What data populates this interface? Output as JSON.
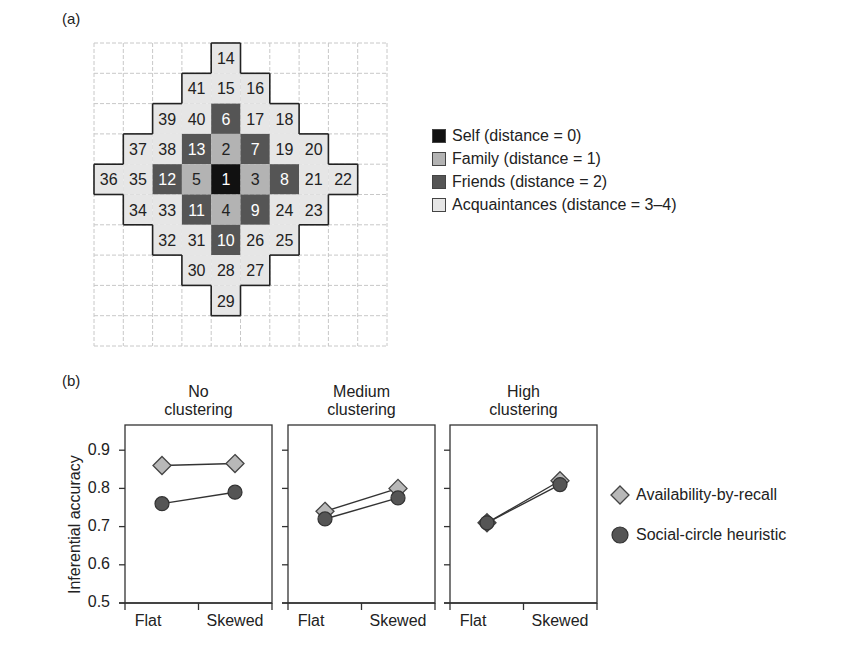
{
  "panel_a": {
    "label": "(a)",
    "grid": {
      "cols": 10,
      "rows": 10,
      "cells": [
        {
          "n": "14",
          "r": 0,
          "c": 4,
          "cat": "acq"
        },
        {
          "n": "41",
          "r": 1,
          "c": 3,
          "cat": "acq"
        },
        {
          "n": "15",
          "r": 1,
          "c": 4,
          "cat": "acq"
        },
        {
          "n": "16",
          "r": 1,
          "c": 5,
          "cat": "acq"
        },
        {
          "n": "39",
          "r": 2,
          "c": 2,
          "cat": "acq"
        },
        {
          "n": "40",
          "r": 2,
          "c": 3,
          "cat": "acq"
        },
        {
          "n": "6",
          "r": 2,
          "c": 4,
          "cat": "friends"
        },
        {
          "n": "17",
          "r": 2,
          "c": 5,
          "cat": "acq"
        },
        {
          "n": "18",
          "r": 2,
          "c": 6,
          "cat": "acq"
        },
        {
          "n": "37",
          "r": 3,
          "c": 1,
          "cat": "acq"
        },
        {
          "n": "38",
          "r": 3,
          "c": 2,
          "cat": "acq"
        },
        {
          "n": "13",
          "r": 3,
          "c": 3,
          "cat": "friends"
        },
        {
          "n": "2",
          "r": 3,
          "c": 4,
          "cat": "family"
        },
        {
          "n": "7",
          "r": 3,
          "c": 5,
          "cat": "friends"
        },
        {
          "n": "19",
          "r": 3,
          "c": 6,
          "cat": "acq"
        },
        {
          "n": "20",
          "r": 3,
          "c": 7,
          "cat": "acq"
        },
        {
          "n": "36",
          "r": 4,
          "c": 0,
          "cat": "acq"
        },
        {
          "n": "35",
          "r": 4,
          "c": 1,
          "cat": "acq"
        },
        {
          "n": "12",
          "r": 4,
          "c": 2,
          "cat": "friends"
        },
        {
          "n": "5",
          "r": 4,
          "c": 3,
          "cat": "family"
        },
        {
          "n": "1",
          "r": 4,
          "c": 4,
          "cat": "self"
        },
        {
          "n": "3",
          "r": 4,
          "c": 5,
          "cat": "family"
        },
        {
          "n": "8",
          "r": 4,
          "c": 6,
          "cat": "friends"
        },
        {
          "n": "21",
          "r": 4,
          "c": 7,
          "cat": "acq"
        },
        {
          "n": "22",
          "r": 4,
          "c": 8,
          "cat": "acq"
        },
        {
          "n": "34",
          "r": 5,
          "c": 1,
          "cat": "acq"
        },
        {
          "n": "33",
          "r": 5,
          "c": 2,
          "cat": "acq"
        },
        {
          "n": "11",
          "r": 5,
          "c": 3,
          "cat": "friends"
        },
        {
          "n": "4",
          "r": 5,
          "c": 4,
          "cat": "family"
        },
        {
          "n": "9",
          "r": 5,
          "c": 5,
          "cat": "friends"
        },
        {
          "n": "24",
          "r": 5,
          "c": 6,
          "cat": "acq"
        },
        {
          "n": "23",
          "r": 5,
          "c": 7,
          "cat": "acq"
        },
        {
          "n": "32",
          "r": 6,
          "c": 2,
          "cat": "acq"
        },
        {
          "n": "31",
          "r": 6,
          "c": 3,
          "cat": "acq"
        },
        {
          "n": "10",
          "r": 6,
          "c": 4,
          "cat": "friends"
        },
        {
          "n": "26",
          "r": 6,
          "c": 5,
          "cat": "acq"
        },
        {
          "n": "25",
          "r": 6,
          "c": 6,
          "cat": "acq"
        },
        {
          "n": "30",
          "r": 7,
          "c": 3,
          "cat": "acq"
        },
        {
          "n": "28",
          "r": 7,
          "c": 4,
          "cat": "acq"
        },
        {
          "n": "27",
          "r": 7,
          "c": 5,
          "cat": "acq"
        },
        {
          "n": "29",
          "r": 8,
          "c": 4,
          "cat": "acq"
        }
      ]
    },
    "legend": [
      {
        "key": "self",
        "label": "Self (distance = 0)",
        "color": "#111111"
      },
      {
        "key": "family",
        "label": "Family (distance = 1)",
        "color": "#b3b3b3"
      },
      {
        "key": "friends",
        "label": "Friends (distance = 2)",
        "color": "#555555"
      },
      {
        "key": "acq",
        "label": "Acquaintances (distance = 3–4)",
        "color": "#e6e6e6"
      }
    ]
  },
  "panel_b": {
    "label": "(b)",
    "ylabel": "Inferential accuracy",
    "yticks": [
      "0.9",
      "0.8",
      "0.7",
      "0.6",
      "0.5"
    ],
    "xticks": [
      "Flat",
      "Skewed"
    ],
    "panels": [
      {
        "title_line1": "No",
        "title_line2": "clustering"
      },
      {
        "title_line1": "Medium",
        "title_line2": "clustering"
      },
      {
        "title_line1": "High",
        "title_line2": "clustering"
      }
    ],
    "legend": [
      {
        "label": "Availability-by-recall",
        "marker": "diamond",
        "color": "#b8b8b8"
      },
      {
        "label": "Social-circle heuristic",
        "marker": "circle",
        "color": "#555555"
      }
    ]
  },
  "chart_data": [
    {
      "type": "table",
      "title": "(a) Social network grid",
      "categories": [
        "Self (distance = 0)",
        "Family (distance = 1)",
        "Friends (distance = 2)",
        "Acquaintances (distance = 3–4)"
      ],
      "grid_size": [
        10,
        10
      ],
      "members": {
        "self": [
          "1"
        ],
        "family": [
          "2",
          "3",
          "4",
          "5"
        ],
        "friends": [
          "6",
          "7",
          "8",
          "9",
          "10",
          "11",
          "12",
          "13"
        ],
        "acquaintances": [
          "14",
          "15",
          "16",
          "17",
          "18",
          "19",
          "20",
          "21",
          "22",
          "23",
          "24",
          "25",
          "26",
          "27",
          "28",
          "29",
          "30",
          "31",
          "32",
          "33",
          "34",
          "35",
          "36",
          "37",
          "38",
          "39",
          "40",
          "41"
        ]
      }
    },
    {
      "type": "line",
      "title": "(b) Inferential accuracy by clustering",
      "subplots": [
        "No clustering",
        "Medium clustering",
        "High clustering"
      ],
      "categories": [
        "Flat",
        "Skewed"
      ],
      "xlabel": "",
      "ylabel": "Inferential accuracy",
      "ylim": [
        0.5,
        0.95
      ],
      "yticks": [
        0.5,
        0.6,
        0.7,
        0.8,
        0.9
      ],
      "grid": false,
      "legend_position": "right",
      "series": [
        {
          "name": "Availability-by-recall",
          "marker": "diamond",
          "values": {
            "No clustering": [
              0.86,
              0.865
            ],
            "Medium clustering": [
              0.74,
              0.8
            ],
            "High clustering": [
              0.71,
              0.82
            ]
          }
        },
        {
          "name": "Social-circle heuristic",
          "marker": "circle",
          "values": {
            "No clustering": [
              0.76,
              0.79
            ],
            "Medium clustering": [
              0.72,
              0.775
            ],
            "High clustering": [
              0.71,
              0.81
            ]
          }
        }
      ]
    }
  ]
}
